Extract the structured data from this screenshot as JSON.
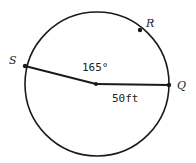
{
  "diagram": {
    "type": "circle-geometry",
    "points": {
      "S": {
        "label": "S"
      },
      "R": {
        "label": "R"
      },
      "Q": {
        "label": "Q"
      }
    },
    "central_angle": {
      "label": "165°",
      "value": 165,
      "unit": "degrees"
    },
    "radius": {
      "label": "50ft",
      "value": 50,
      "unit": "ft"
    },
    "colors": {
      "stroke": "#1a1a1a",
      "background": "#ffffff"
    }
  }
}
